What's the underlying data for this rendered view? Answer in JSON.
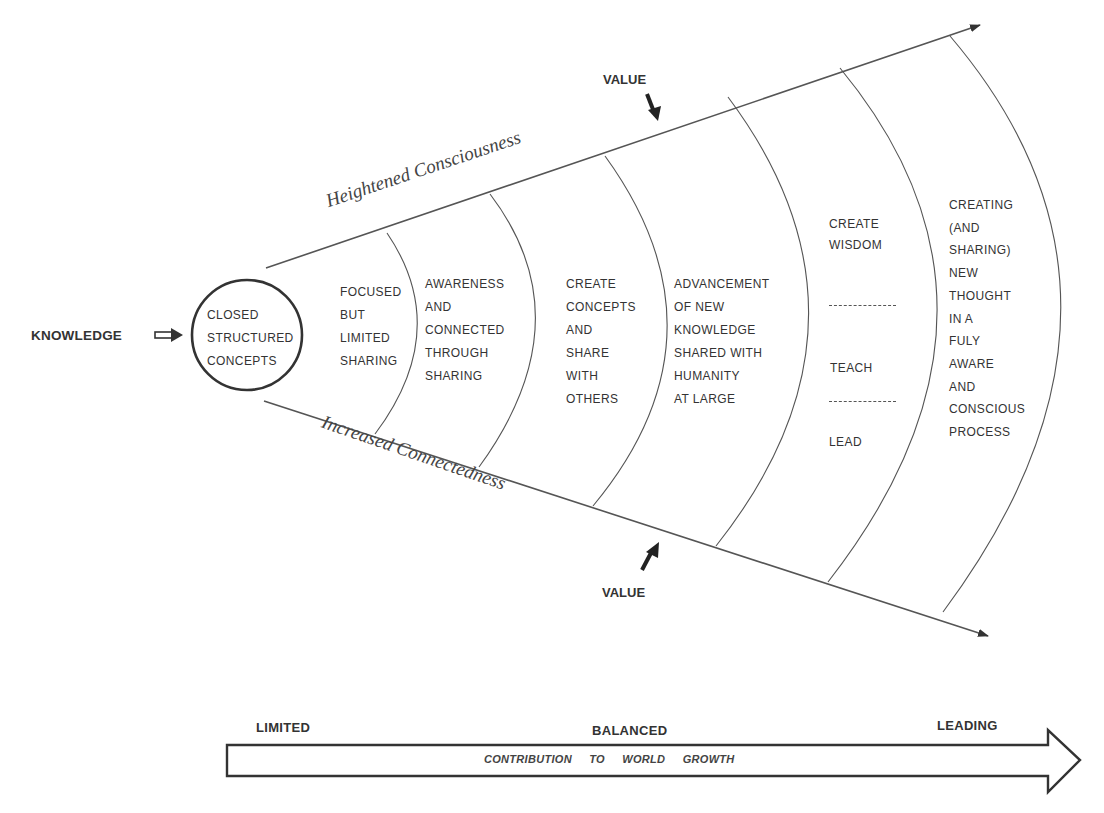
{
  "input": {
    "label": "KNOWLEDGE",
    "arrow_icon": "fat-right-arrow"
  },
  "core": {
    "lines": [
      "CLOSED",
      "STRUCTURED",
      "CONCEPTS"
    ]
  },
  "stages": [
    {
      "id": "stage-1",
      "lines": [
        "FOCUSED",
        "BUT",
        "LIMITED",
        "SHARING"
      ]
    },
    {
      "id": "stage-2",
      "lines": [
        "AWARENESS",
        "AND",
        "CONNECTED",
        "THROUGH",
        "SHARING"
      ]
    },
    {
      "id": "stage-3",
      "lines": [
        "CREATE",
        "CONCEPTS",
        "AND",
        "SHARE",
        "WITH",
        "OTHERS"
      ]
    },
    {
      "id": "stage-4",
      "lines": [
        "ADVANCEMENT",
        "OF NEW",
        "KNOWLEDGE",
        "SHARED WITH",
        "HUMANITY",
        "AT LARGE"
      ]
    },
    {
      "id": "stage-5",
      "groups": [
        {
          "lines": [
            "CREATE",
            "WISDOM"
          ]
        },
        {
          "lines": [
            "TEACH"
          ]
        },
        {
          "lines": [
            "LEAD"
          ]
        }
      ],
      "separator": "------------"
    },
    {
      "id": "stage-6",
      "lines": [
        "CREATING",
        "(AND",
        "SHARING)",
        "NEW",
        "THOUGHT",
        "IN A",
        "FULY",
        "AWARE",
        "AND",
        "CONSCIOUS",
        "PROCESS"
      ]
    }
  ],
  "axes": {
    "top": {
      "label": "Heightened Consciousness"
    },
    "bottom": {
      "label": "Increased Connectedness"
    }
  },
  "value_markers": {
    "top": {
      "label": "VALUE"
    },
    "bottom": {
      "label": "VALUE"
    }
  },
  "scale": {
    "left": "LIMITED",
    "center": "BALANCED",
    "right": "LEADING",
    "bar_text": "CONTRIBUTION TO WORLD GROWTH"
  },
  "colors": {
    "line": "#444444",
    "text": "#333333",
    "background": "#ffffff"
  }
}
